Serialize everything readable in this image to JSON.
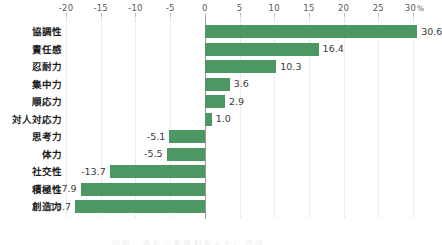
{
  "chart_data": {
    "type": "bar",
    "orientation": "horizontal",
    "title": "",
    "subtitle": "",
    "xlabel": "",
    "ylabel": "",
    "xlim": [
      -20,
      30
    ],
    "grid": true,
    "legend": null,
    "axis_unit": "%",
    "bar_color": "#4d9762",
    "zero_line_color": "#9a9a9a",
    "gridline_color": "#d9d9d9",
    "xticks": [
      -20,
      -15,
      -10,
      -5,
      0,
      5,
      10,
      15,
      20,
      25,
      30
    ],
    "xtick_labels": [
      "-20",
      "-15",
      "-10",
      "-5",
      "0",
      "5",
      "10",
      "15",
      "20",
      "25",
      "30"
    ],
    "xtick_last_suffix": "%",
    "categories": [
      "協調性",
      "責任感",
      "忍耐力",
      "集中力",
      "順応力",
      "対人対応力",
      "思考力",
      "体力",
      "社交性",
      "積極性",
      "創造力"
    ],
    "values": [
      30.6,
      16.4,
      10.3,
      3.6,
      2.9,
      1.0,
      -5.1,
      -5.5,
      -13.7,
      -17.9,
      -18.7
    ],
    "value_labels": [
      "30.6",
      "16.4",
      "10.3",
      "3.6",
      "2.9",
      "1.0",
      "-5.1",
      "-5.5",
      "-13.7",
      "-17.9",
      "-18.7"
    ]
  },
  "footer": {
    "clipped_caption": "出所：各社公表資料をもとに作成"
  }
}
